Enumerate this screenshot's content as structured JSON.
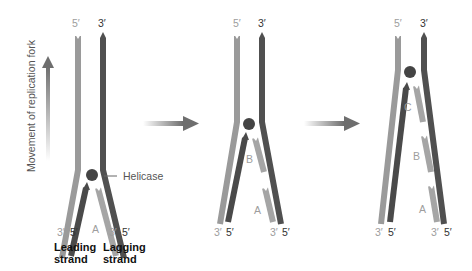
{
  "figure": {
    "colors": {
      "parental_light": "#9a9a9a",
      "parental_dark": "#505050",
      "new_light": "#a5a5a5",
      "new_dark": "#4a4a4a",
      "helicase": "#444444",
      "label_light": "#9d9d9d",
      "label_dark": "#333333",
      "arrow": "#6e6e6e"
    },
    "axis_label": "Movement of replication fork",
    "helicase_label": "Helicase",
    "strand_labels": {
      "leading": "Leading\nstrand",
      "leading_line1": "Leading",
      "leading_line2": "strand",
      "lagging_line1": "Lagging",
      "lagging_line2": "strand"
    },
    "panels": [
      {
        "id": 1,
        "top_left": "5′",
        "top_right": "3′",
        "bottom": [
          "3′",
          "5′",
          "3′",
          "5′"
        ],
        "fragments": [
          "A"
        ]
      },
      {
        "id": 2,
        "top_left": "5′",
        "top_right": "3′",
        "bottom": [
          "3′",
          "5′",
          "3′",
          "5′"
        ],
        "fragments": [
          "B",
          "A"
        ]
      },
      {
        "id": 3,
        "top_left": "5′",
        "top_right": "3′",
        "bottom": [
          "3′",
          "5′",
          "3′",
          "5′"
        ],
        "fragments": [
          "C",
          "B",
          "A"
        ]
      }
    ]
  }
}
